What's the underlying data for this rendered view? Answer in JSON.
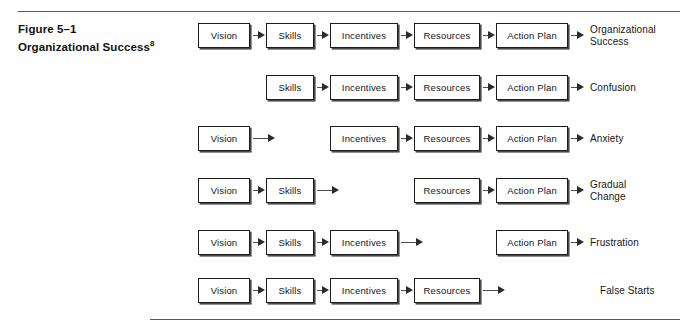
{
  "figure": {
    "caption_line1": "Figure 5–1",
    "caption_line2": "Organizational Success",
    "caption_superscript": "8"
  },
  "columns": [
    {
      "key": "vision",
      "label": "Vision",
      "x": 198,
      "width": 52
    },
    {
      "key": "skills",
      "label": "Skills",
      "x": 266,
      "width": 48
    },
    {
      "key": "incentives",
      "label": "Incentives",
      "x": 330,
      "width": 68
    },
    {
      "key": "resources",
      "label": "Resources",
      "x": 414,
      "width": 66
    },
    {
      "key": "action_plan",
      "label": "Action Plan",
      "x": 496,
      "width": 72
    }
  ],
  "rows": [
    {
      "id": "row-organizational-success",
      "y": 21,
      "boxes": [
        "vision",
        "skills",
        "incentives",
        "resources",
        "action_plan"
      ],
      "missing": null,
      "outcome": "Organizational Success",
      "outcome_lines": [
        "Organizational",
        "Success"
      ],
      "outcome_arrow": true
    },
    {
      "id": "row-confusion",
      "y": 73,
      "boxes": [
        "skills",
        "incentives",
        "resources",
        "action_plan"
      ],
      "missing": "vision",
      "outcome": "Confusion",
      "outcome_lines": [
        "Confusion"
      ],
      "outcome_arrow": true
    },
    {
      "id": "row-anxiety",
      "y": 124,
      "boxes": [
        "vision",
        "incentives",
        "resources",
        "action_plan"
      ],
      "missing": "skills",
      "outcome": "Anxiety",
      "outcome_lines": [
        "Anxiety"
      ],
      "outcome_arrow": true
    },
    {
      "id": "row-gradual-change",
      "y": 176,
      "boxes": [
        "vision",
        "skills",
        "resources",
        "action_plan"
      ],
      "missing": "incentives",
      "outcome": "Gradual Change",
      "outcome_lines": [
        "Gradual",
        "Change"
      ],
      "outcome_arrow": true
    },
    {
      "id": "row-frustration",
      "y": 228,
      "boxes": [
        "vision",
        "skills",
        "incentives",
        "action_plan"
      ],
      "missing": "resources",
      "outcome": "Frustration",
      "outcome_lines": [
        "Frustration"
      ],
      "outcome_arrow": true
    },
    {
      "id": "row-false-starts",
      "y": 276,
      "boxes": [
        "vision",
        "skills",
        "incentives",
        "resources"
      ],
      "missing": "action_plan",
      "outcome": "False Starts",
      "outcome_lines": [
        "False Starts"
      ],
      "outcome_arrow": false
    }
  ],
  "layout": {
    "outcome_x": 590,
    "outcome_arrow_x": 572,
    "false_starts_x": 600
  },
  "colors": {
    "box_border": "#1d1d1d",
    "box_shadow": "#4a4a4a",
    "arrow": "#2b2b2b",
    "rule": "#5a5a5a",
    "text": "#15171a",
    "page_background": "#ffffff"
  }
}
